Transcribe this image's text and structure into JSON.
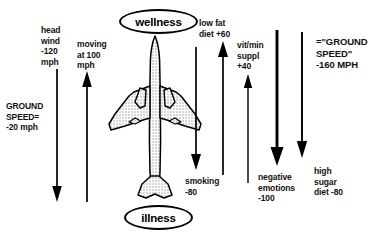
{
  "diagram": {
    "title_nodes": {
      "top": "wellness",
      "bottom": "illness"
    },
    "center_graphic": "airplane-top-view-icon",
    "labels": {
      "head_wind": "head\nwind\n-120\nmph",
      "ground_speed_left": "GROUND\nSPEED=\n-20 mph",
      "moving_at": "moving\nat 100\nmph",
      "low_fat": "low fat\ndiet +60",
      "vit_min": "vit/min\nsuppl\n+40",
      "smoking": "smoking\n-80",
      "negative_emotions": "negative\nemotions\n-100",
      "ground_speed_right": "=\"GROUND\nSPEED\"\n-160 MPH",
      "high_sugar": "high\nsugar\ndiet -80"
    },
    "arrows": [
      {
        "name": "head-wind-arrow",
        "direction": "down",
        "value": -120,
        "label": "head wind -120 mph"
      },
      {
        "name": "moving-at-100-arrow",
        "direction": "up",
        "value": 100,
        "label": "moving at 100 mph"
      },
      {
        "name": "smoking-arrow",
        "direction": "down",
        "value": -80,
        "label": "smoking -80"
      },
      {
        "name": "low-fat-diet-arrow",
        "direction": "up",
        "value": 60,
        "label": "low fat diet +60"
      },
      {
        "name": "vitamin-mineral-supplement-arrow",
        "direction": "up",
        "value": 40,
        "label": "vit/min suppl +40"
      },
      {
        "name": "negative-emotions-arrow",
        "direction": "down",
        "value": -100,
        "label": "negative emotions -100"
      },
      {
        "name": "high-sugar-diet-arrow",
        "direction": "down",
        "value": -80,
        "label": "high sugar diet -80"
      }
    ],
    "colors": {
      "ink": "#000000",
      "background": "#ffffff",
      "plane_fill": "#d8d8d8"
    }
  }
}
